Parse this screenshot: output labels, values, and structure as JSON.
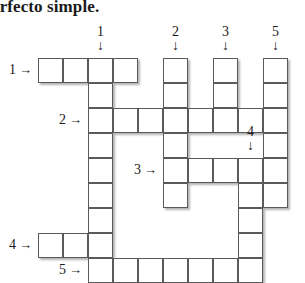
{
  "page": {
    "title_text": "erfecto simple.",
    "background_color": "#ffffff",
    "ink_color": "#1b1b1b",
    "cell_border_color": "#5a5a5a",
    "cell_fill_color": "#ffffff"
  },
  "puzzle": {
    "type": "crossword",
    "cell_size_px": 25,
    "origin": {
      "x": 38,
      "y": 58
    },
    "columns": 10,
    "rows": 9,
    "entries": [
      {
        "number": "1",
        "direction": "across",
        "arrow": "→",
        "row": 0,
        "col": 0,
        "length": 4
      },
      {
        "number": "2",
        "direction": "across",
        "arrow": "→",
        "row": 2,
        "col": 2,
        "length": 8
      },
      {
        "number": "3",
        "direction": "across",
        "arrow": "→",
        "row": 4,
        "col": 5,
        "length": 5
      },
      {
        "number": "4",
        "direction": "across",
        "arrow": "→",
        "row": 7,
        "col": 0,
        "length": 3
      },
      {
        "number": "5",
        "direction": "across",
        "arrow": "→",
        "row": 8,
        "col": 2,
        "length": 7
      },
      {
        "number": "1",
        "direction": "down",
        "arrow": "↓",
        "row": 0,
        "col": 2,
        "length": 8
      },
      {
        "number": "2",
        "direction": "down",
        "arrow": "↓",
        "row": 0,
        "col": 5,
        "length": 6
      },
      {
        "number": "3",
        "direction": "down",
        "arrow": "↓",
        "row": 0,
        "col": 7,
        "length": 3
      },
      {
        "number": "4",
        "direction": "down",
        "arrow": "↓",
        "row": 4,
        "col": 8,
        "length": 5
      },
      {
        "number": "5",
        "direction": "down",
        "arrow": "↓",
        "row": 0,
        "col": 9,
        "length": 9
      }
    ],
    "cells": [
      {
        "row": 0,
        "col": 0,
        "letter": ""
      },
      {
        "row": 0,
        "col": 1,
        "letter": ""
      },
      {
        "row": 0,
        "col": 2,
        "letter": ""
      },
      {
        "row": 0,
        "col": 3,
        "letter": ""
      },
      {
        "row": 0,
        "col": 5,
        "letter": ""
      },
      {
        "row": 0,
        "col": 7,
        "letter": ""
      },
      {
        "row": 0,
        "col": 9,
        "letter": ""
      },
      {
        "row": 1,
        "col": 2,
        "letter": ""
      },
      {
        "row": 1,
        "col": 5,
        "letter": ""
      },
      {
        "row": 1,
        "col": 7,
        "letter": ""
      },
      {
        "row": 1,
        "col": 9,
        "letter": ""
      },
      {
        "row": 2,
        "col": 2,
        "letter": ""
      },
      {
        "row": 2,
        "col": 3,
        "letter": ""
      },
      {
        "row": 2,
        "col": 4,
        "letter": ""
      },
      {
        "row": 2,
        "col": 5,
        "letter": ""
      },
      {
        "row": 2,
        "col": 6,
        "letter": ""
      },
      {
        "row": 2,
        "col": 7,
        "letter": ""
      },
      {
        "row": 2,
        "col": 8,
        "letter": ""
      },
      {
        "row": 2,
        "col": 9,
        "letter": ""
      },
      {
        "row": 3,
        "col": 2,
        "letter": ""
      },
      {
        "row": 3,
        "col": 5,
        "letter": ""
      },
      {
        "row": 3,
        "col": 9,
        "letter": ""
      },
      {
        "row": 4,
        "col": 2,
        "letter": ""
      },
      {
        "row": 4,
        "col": 5,
        "letter": ""
      },
      {
        "row": 4,
        "col": 6,
        "letter": ""
      },
      {
        "row": 4,
        "col": 7,
        "letter": ""
      },
      {
        "row": 4,
        "col": 8,
        "letter": ""
      },
      {
        "row": 4,
        "col": 9,
        "letter": ""
      },
      {
        "row": 5,
        "col": 2,
        "letter": ""
      },
      {
        "row": 5,
        "col": 5,
        "letter": ""
      },
      {
        "row": 5,
        "col": 8,
        "letter": ""
      },
      {
        "row": 5,
        "col": 9,
        "letter": ""
      },
      {
        "row": 6,
        "col": 2,
        "letter": ""
      },
      {
        "row": 6,
        "col": 8,
        "letter": ""
      },
      {
        "row": 7,
        "col": 0,
        "letter": ""
      },
      {
        "row": 7,
        "col": 1,
        "letter": ""
      },
      {
        "row": 7,
        "col": 2,
        "letter": ""
      },
      {
        "row": 7,
        "col": 8,
        "letter": ""
      },
      {
        "row": 8,
        "col": 2,
        "letter": ""
      },
      {
        "row": 8,
        "col": 3,
        "letter": ""
      },
      {
        "row": 8,
        "col": 4,
        "letter": ""
      },
      {
        "row": 8,
        "col": 5,
        "letter": ""
      },
      {
        "row": 8,
        "col": 6,
        "letter": ""
      },
      {
        "row": 8,
        "col": 7,
        "letter": ""
      },
      {
        "row": 8,
        "col": 8,
        "letter": ""
      }
    ]
  }
}
